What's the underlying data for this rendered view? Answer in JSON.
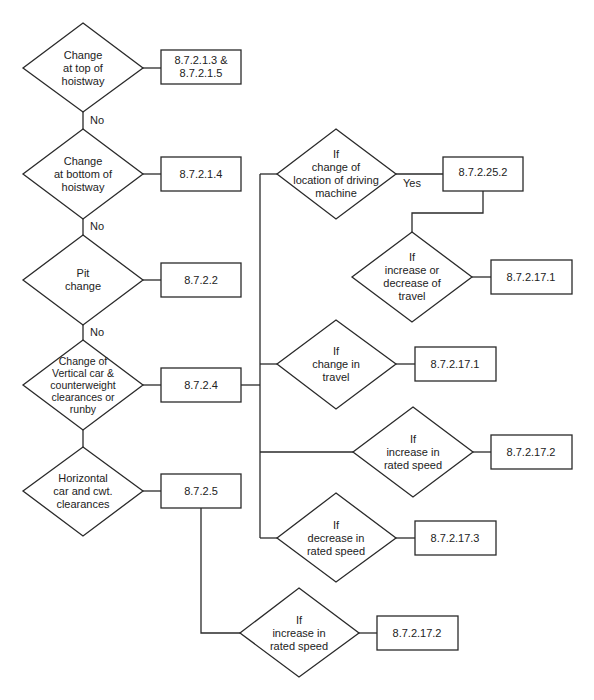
{
  "diagram": {
    "type": "flowchart",
    "line_color": "#2a2a2a",
    "background": "#ffffff",
    "decisions": [
      {
        "id": "d1",
        "text": "Change\nat top of\nhoistway",
        "cx": 83,
        "cy": 68
      },
      {
        "id": "d2",
        "text": "Change\nat bottom of\nhoistway",
        "cx": 83,
        "cy": 174
      },
      {
        "id": "d3",
        "text": "Pit\nchange",
        "cx": 83,
        "cy": 280
      },
      {
        "id": "d4",
        "text": "Change of\nVertical car &\ncounterweight\nclearances or\nrunby",
        "cx": 83,
        "cy": 385
      },
      {
        "id": "d5",
        "text": "Horizontal\ncar and cwt.\nclearances",
        "cx": 83,
        "cy": 491
      },
      {
        "id": "d6",
        "text": "If\nchange of\nlocation of driving\nmachine",
        "cx": 336,
        "cy": 174
      },
      {
        "id": "d7",
        "text": "If\nincrease or\ndecrease of\ntravel",
        "cx": 412,
        "cy": 277
      },
      {
        "id": "d8",
        "text": "If\nchange in\ntravel",
        "cx": 336,
        "cy": 364
      },
      {
        "id": "d9",
        "text": "If\nincrease in\nrated speed",
        "cx": 413,
        "cy": 452
      },
      {
        "id": "d10",
        "text": "If\ndecrease in\nrated speed",
        "cx": 336,
        "cy": 538
      },
      {
        "id": "d11",
        "text": "If\nincrease in\nrated speed",
        "cx": 299,
        "cy": 633
      }
    ],
    "boxes": [
      {
        "id": "b1",
        "text": "8.7.2.1.3 &\n8.7.2.1.5",
        "x": 161,
        "y": 50,
        "w": 80,
        "h": 34
      },
      {
        "id": "b2",
        "text": "8.7.2.1.4",
        "x": 161,
        "y": 157,
        "w": 80,
        "h": 34
      },
      {
        "id": "b3",
        "text": "8.7.2.2",
        "x": 161,
        "y": 263,
        "w": 80,
        "h": 34
      },
      {
        "id": "b4",
        "text": "8.7.2.4",
        "x": 161,
        "y": 368,
        "w": 80,
        "h": 34
      },
      {
        "id": "b5",
        "text": "8.7.2.5",
        "x": 161,
        "y": 474,
        "w": 80,
        "h": 34
      },
      {
        "id": "b6",
        "text": "8.7.2.25.2",
        "x": 443,
        "y": 157,
        "w": 80,
        "h": 34
      },
      {
        "id": "b7",
        "text": "8.7.2.17.1",
        "x": 491,
        "y": 260,
        "w": 81,
        "h": 34
      },
      {
        "id": "b8",
        "text": "8.7.2.17.1",
        "x": 415,
        "y": 347,
        "w": 81,
        "h": 34
      },
      {
        "id": "b9",
        "text": "8.7.2.17.2",
        "x": 491,
        "y": 435,
        "w": 81,
        "h": 34
      },
      {
        "id": "b10",
        "text": "8.7.2.17.3",
        "x": 415,
        "y": 521,
        "w": 81,
        "h": 34
      },
      {
        "id": "b11",
        "text": "8.7.2.17.2",
        "x": 377,
        "y": 616,
        "w": 81,
        "h": 34
      }
    ],
    "edge_labels": [
      {
        "text": "No",
        "x": 90,
        "y": 115
      },
      {
        "text": "No",
        "x": 90,
        "y": 221
      },
      {
        "text": "No",
        "x": 90,
        "y": 327
      },
      {
        "text": "Yes",
        "x": 403,
        "y": 178
      }
    ]
  }
}
